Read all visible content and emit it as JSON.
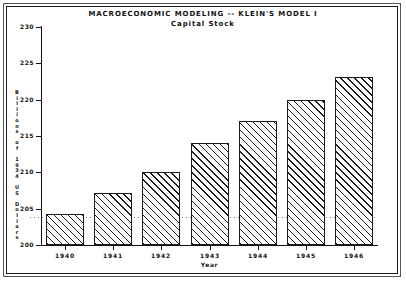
{
  "chart_data": {
    "type": "bar",
    "title": "MACROECONOMIC MODELING -- KLEIN'S MODEL I",
    "subtitle": "Capital Stock",
    "xlabel": "Year",
    "ylabel": "Billions of 1934 US Dollars",
    "categories": [
      "1940",
      "1941",
      "1942",
      "1943",
      "1944",
      "1945",
      "1946"
    ],
    "values": [
      204.3,
      207.1,
      210.1,
      214.0,
      217.0,
      220.0,
      223.1
    ],
    "ylim": [
      200,
      230
    ],
    "yticks": [
      "230",
      "225",
      "220",
      "215",
      "210",
      "205",
      "200"
    ],
    "ytick_values": [
      230,
      225,
      220,
      215,
      210,
      205,
      200
    ],
    "grid": false,
    "reference_line": 203.8,
    "legend": "none",
    "bar_fill": "diagonal-hatch",
    "bar_edge_color": "#1b1b1b",
    "background_color": "#ffffff"
  },
  "figure": {
    "frame": "double-border"
  }
}
